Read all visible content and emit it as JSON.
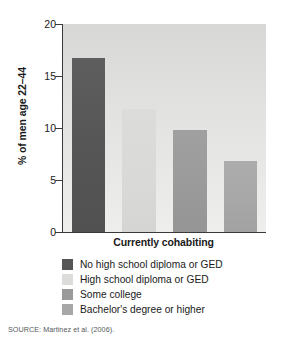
{
  "chart_data": {
    "type": "bar",
    "title": "",
    "xlabel": "Currently cohabiting",
    "ylabel": "% of men age 22–44",
    "ylim": [
      0,
      20
    ],
    "yticks": [
      0,
      5,
      10,
      15,
      20
    ],
    "ytick_labels": [
      "0",
      "5",
      "10",
      "15",
      "20"
    ],
    "grid": false,
    "legend_position": "below",
    "categories": [
      "No high school diploma or GED",
      "High school diploma or GED",
      "Some college",
      "Bachelor's degree or higher"
    ],
    "values": [
      16.7,
      11.8,
      9.8,
      6.8
    ],
    "colors": [
      "#565656",
      "#dcdcda",
      "#9a9a9a",
      "#a7a7a7"
    ],
    "series": [
      {
        "name": "Currently cohabiting",
        "values": [
          16.7,
          11.8,
          9.8,
          6.8
        ]
      }
    ]
  },
  "legend": {
    "items": [
      {
        "label": "No high school diploma or GED",
        "color": "#565656"
      },
      {
        "label": "High school diploma or GED",
        "color": "#dcdcda"
      },
      {
        "label": "Some college",
        "color": "#9a9a9a"
      },
      {
        "label": "Bachelor's degree or higher",
        "color": "#a7a7a7"
      }
    ]
  },
  "source": {
    "text": "SOURCE: Martinez et al. (2006)."
  }
}
